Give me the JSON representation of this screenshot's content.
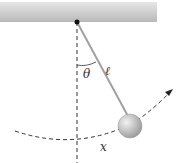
{
  "diagram": {
    "labels": {
      "angle": "θ",
      "length": "ℓ",
      "arc": "x"
    },
    "colors": {
      "ceiling": "#c8c8c8",
      "rod": "#999999",
      "bob": "#b8b8b8",
      "dash": "#333333"
    }
  }
}
